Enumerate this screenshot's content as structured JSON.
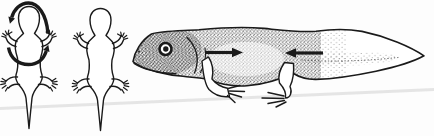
{
  "colors": {
    "ink": "#1a1a1a",
    "paper": "#fdfdfd",
    "crease": "#e4e4e4",
    "eye_white": "#ffffff"
  },
  "figure": {
    "panels": {
      "dorsal_rotated": {
        "label": "salamander dorsal view encircled by two curved rotation arrows"
      },
      "dorsal_plain": {
        "label": "salamander dorsal view outline"
      },
      "lateral_larva": {
        "label": "stippled salamander larva in side view with opposing flank arrows"
      }
    },
    "arrows": {
      "arc_upper": {
        "direction": "counterclockwise arc over head, arrowhead lower-left"
      },
      "arc_lower": {
        "direction": "counterclockwise arc under forelimbs, arrowhead upper-right"
      },
      "flank_forward": {
        "direction": "pointing right at shoulder"
      },
      "flank_backward": {
        "direction": "pointing left at hip"
      }
    }
  }
}
